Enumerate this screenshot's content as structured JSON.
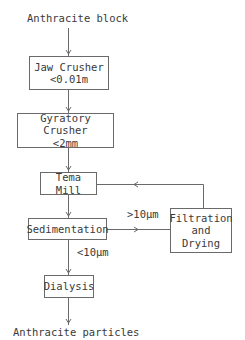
{
  "diagram": {
    "type": "process-flowchart",
    "input_label": "Anthracite block",
    "output_label": "Anthracite particles",
    "nodes": {
      "jaw_crusher": {
        "name": "Jaw Crusher",
        "spec": "<0.01m"
      },
      "gyratory_crusher": {
        "name": "Gyratory Crusher",
        "spec": "<2mm"
      },
      "tema_mill": {
        "name": "Tema Mill"
      },
      "sedimentation": {
        "name": "Sedimentation"
      },
      "filtration": {
        "line1": "Filtration",
        "line2": "and",
        "line3": "Drying"
      },
      "dialysis": {
        "name": "Dialysis"
      }
    },
    "edge_labels": {
      "coarse": ">10µm",
      "fine": "<10µm"
    },
    "edges": [
      {
        "from": "Anthracite block",
        "to": "Jaw Crusher"
      },
      {
        "from": "Jaw Crusher",
        "to": "Gyratory Crusher"
      },
      {
        "from": "Gyratory Crusher",
        "to": "Tema Mill"
      },
      {
        "from": "Tema Mill",
        "to": "Sedimentation"
      },
      {
        "from": "Sedimentation",
        "to": "Filtration and Drying",
        "label": ">10µm"
      },
      {
        "from": "Filtration and Drying",
        "to": "Tema Mill"
      },
      {
        "from": "Sedimentation",
        "to": "Dialysis",
        "label": "<10µm"
      },
      {
        "from": "Dialysis",
        "to": "Anthracite particles"
      }
    ],
    "colors": {
      "line": "#6a6a6a",
      "text": "#3a3a3a",
      "background": "#ffffff"
    }
  }
}
